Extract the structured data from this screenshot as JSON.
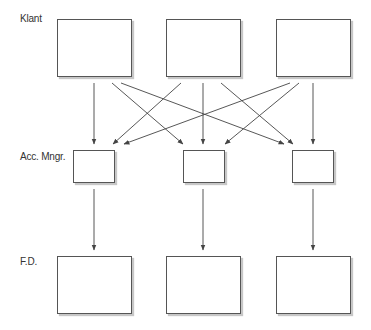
{
  "diagram": {
    "rows": [
      {
        "label": "Klant"
      },
      {
        "label": "Acc. Mngr."
      },
      {
        "label": "F.D."
      }
    ],
    "colors": {
      "stroke": "#444444",
      "box_border": "#555555",
      "label": "#333333",
      "background": "#ffffff"
    },
    "nodes": {
      "klant": [
        {
          "id": "klant-1",
          "x": 57,
          "y": 19,
          "w": 75,
          "h": 58
        },
        {
          "id": "klant-2",
          "x": 166,
          "y": 19,
          "w": 75,
          "h": 58
        },
        {
          "id": "klant-3",
          "x": 276,
          "y": 19,
          "w": 75,
          "h": 58
        }
      ],
      "acc_mngr": [
        {
          "id": "acc-mngr-1",
          "x": 73,
          "y": 150,
          "w": 42,
          "h": 33
        },
        {
          "id": "acc-mngr-2",
          "x": 183,
          "y": 150,
          "w": 42,
          "h": 33
        },
        {
          "id": "acc-mngr-3",
          "x": 292,
          "y": 150,
          "w": 42,
          "h": 33
        }
      ],
      "fd": [
        {
          "id": "fd-1",
          "x": 57,
          "y": 256,
          "w": 75,
          "h": 58
        },
        {
          "id": "fd-2",
          "x": 166,
          "y": 256,
          "w": 75,
          "h": 58
        },
        {
          "id": "fd-3",
          "x": 276,
          "y": 256,
          "w": 75,
          "h": 58
        }
      ]
    },
    "edges": [
      {
        "from": "klant-1",
        "to": "acc-mngr-1",
        "x1": 94,
        "y1": 83,
        "x2": 94,
        "y2": 144
      },
      {
        "from": "klant-1",
        "to": "acc-mngr-2",
        "x1": 112,
        "y1": 83,
        "x2": 183,
        "y2": 144
      },
      {
        "from": "klant-1",
        "to": "acc-mngr-3",
        "x1": 121,
        "y1": 83,
        "x2": 284,
        "y2": 144
      },
      {
        "from": "klant-2",
        "to": "acc-mngr-1",
        "x1": 181,
        "y1": 83,
        "x2": 113,
        "y2": 144
      },
      {
        "from": "klant-2",
        "to": "acc-mngr-2",
        "x1": 203,
        "y1": 83,
        "x2": 203,
        "y2": 144
      },
      {
        "from": "klant-2",
        "to": "acc-mngr-3",
        "x1": 221,
        "y1": 83,
        "x2": 293,
        "y2": 144
      },
      {
        "from": "klant-3",
        "to": "acc-mngr-1",
        "x1": 290,
        "y1": 83,
        "x2": 124,
        "y2": 144
      },
      {
        "from": "klant-3",
        "to": "acc-mngr-2",
        "x1": 299,
        "y1": 83,
        "x2": 225,
        "y2": 144
      },
      {
        "from": "klant-3",
        "to": "acc-mngr-3",
        "x1": 313,
        "y1": 83,
        "x2": 313,
        "y2": 144
      },
      {
        "from": "acc-mngr-1",
        "to": "fd-1",
        "x1": 94,
        "y1": 189,
        "x2": 94,
        "y2": 250
      },
      {
        "from": "acc-mngr-2",
        "to": "fd-2",
        "x1": 203,
        "y1": 189,
        "x2": 203,
        "y2": 250
      },
      {
        "from": "acc-mngr-3",
        "to": "fd-3",
        "x1": 313,
        "y1": 189,
        "x2": 313,
        "y2": 250
      }
    ]
  }
}
